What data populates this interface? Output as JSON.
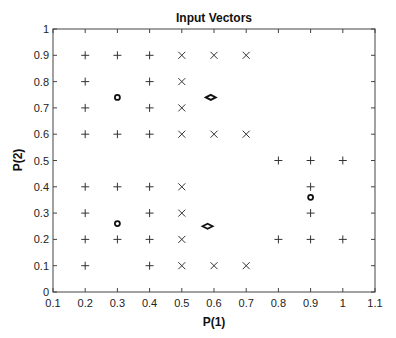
{
  "chart_data": {
    "type": "scatter",
    "title": "Input Vectors",
    "xlabel": "P(1)",
    "ylabel": "P(2)",
    "xlim": [
      0.1,
      1.1
    ],
    "ylim": [
      0,
      1
    ],
    "xticks": [
      0.1,
      0.2,
      0.3,
      0.4,
      0.5,
      0.6,
      0.7,
      0.8,
      0.9,
      1,
      1.1
    ],
    "xtick_labels": [
      "0.1",
      "0.2",
      "0.3",
      "0.4",
      "0.5",
      "0.6",
      "0.7",
      "0.8",
      "0.9",
      "1",
      "1.1"
    ],
    "yticks": [
      0,
      0.1,
      0.2,
      0.3,
      0.4,
      0.5,
      0.6,
      0.7,
      0.8,
      0.9,
      1
    ],
    "ytick_labels": [
      "0",
      "0.1",
      "0.2",
      "0.3",
      "0.4",
      "0.5",
      "0.6",
      "0.7",
      "0.8",
      "0.9",
      "1"
    ],
    "grid": false,
    "legend": null,
    "series": [
      {
        "name": "plus",
        "marker": "+",
        "color": "#333333",
        "points": [
          [
            0.2,
            0.9
          ],
          [
            0.3,
            0.9
          ],
          [
            0.4,
            0.9
          ],
          [
            0.2,
            0.8
          ],
          [
            0.4,
            0.8
          ],
          [
            0.2,
            0.7
          ],
          [
            0.4,
            0.7
          ],
          [
            0.2,
            0.6
          ],
          [
            0.3,
            0.6
          ],
          [
            0.4,
            0.6
          ],
          [
            0.2,
            0.4
          ],
          [
            0.3,
            0.4
          ],
          [
            0.4,
            0.4
          ],
          [
            0.2,
            0.3
          ],
          [
            0.4,
            0.3
          ],
          [
            0.2,
            0.2
          ],
          [
            0.3,
            0.2
          ],
          [
            0.4,
            0.2
          ],
          [
            0.2,
            0.1
          ],
          [
            0.4,
            0.1
          ],
          [
            0.8,
            0.5
          ],
          [
            0.9,
            0.5
          ],
          [
            1.0,
            0.5
          ],
          [
            0.9,
            0.4
          ],
          [
            0.9,
            0.3
          ],
          [
            0.8,
            0.2
          ],
          [
            0.9,
            0.2
          ],
          [
            1.0,
            0.2
          ]
        ]
      },
      {
        "name": "cross",
        "marker": "x",
        "color": "#333333",
        "points": [
          [
            0.5,
            0.9
          ],
          [
            0.6,
            0.9
          ],
          [
            0.7,
            0.9
          ],
          [
            0.5,
            0.8
          ],
          [
            0.5,
            0.7
          ],
          [
            0.5,
            0.6
          ],
          [
            0.6,
            0.6
          ],
          [
            0.7,
            0.6
          ],
          [
            0.5,
            0.4
          ],
          [
            0.5,
            0.3
          ],
          [
            0.5,
            0.2
          ],
          [
            0.5,
            0.1
          ],
          [
            0.6,
            0.1
          ],
          [
            0.7,
            0.1
          ]
        ]
      },
      {
        "name": "circle",
        "marker": "o",
        "color": "#111111",
        "points": [
          [
            0.3,
            0.74
          ],
          [
            0.3,
            0.26
          ],
          [
            0.9,
            0.36
          ]
        ]
      },
      {
        "name": "diamond",
        "marker": "diamond",
        "color": "#111111",
        "points": [
          [
            0.59,
            0.74
          ],
          [
            0.58,
            0.25
          ]
        ]
      }
    ]
  },
  "layout": {
    "plot_left": 53,
    "plot_top": 29,
    "plot_right": 375,
    "plot_bottom": 292
  }
}
